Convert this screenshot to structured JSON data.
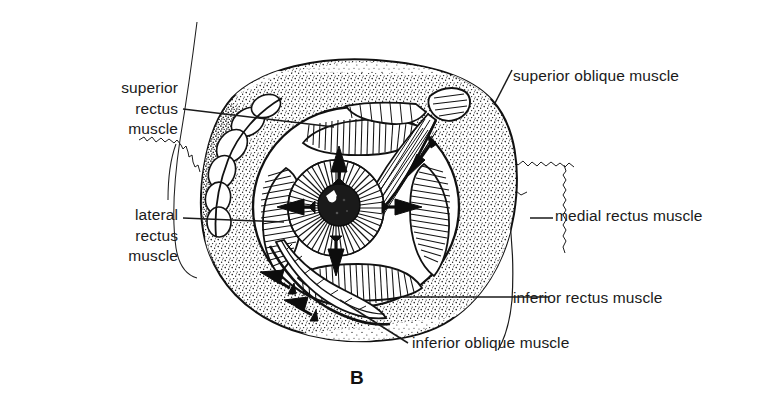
{
  "figure": {
    "panel_letter": "B",
    "ink_color": "#111111",
    "text_color": "#1a1a1a",
    "background_color": "#ffffff"
  },
  "labels": {
    "superior_rectus": {
      "line1": "superior",
      "line2": "rectus",
      "line3": "muscle"
    },
    "lateral_rectus": {
      "line1": "lateral",
      "line2": "rectus",
      "line3": "muscle"
    },
    "superior_oblique": {
      "text": "superior oblique muscle"
    },
    "medial_rectus": {
      "text": "medial rectus muscle"
    },
    "inferior_rectus": {
      "text": "inferior rectus muscle"
    },
    "inferior_oblique": {
      "text": "inferior oblique muscle"
    }
  },
  "arrows": {
    "superior_rectus_action": "up",
    "inferior_rectus_action": "down",
    "lateral_rectus_action": "left",
    "medial_rectus_action": "right",
    "superior_oblique_action": "down-left-diagonal",
    "inferior_oblique_action": "down-left-diagonal"
  },
  "structures": [
    "orbital-fat",
    "lacrimal-gland",
    "eyeball-sclera",
    "iris",
    "pupil",
    "superior-rectus-muscle",
    "inferior-rectus-muscle",
    "lateral-rectus-muscle",
    "medial-rectus-muscle",
    "superior-oblique-tendon",
    "inferior-oblique-muscle",
    "trochlea",
    "nasal-bone-contour",
    "cranial-suture-line"
  ]
}
